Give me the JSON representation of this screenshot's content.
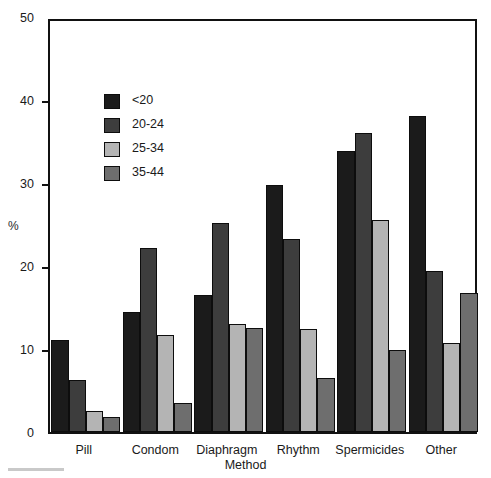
{
  "chart_data": {
    "type": "bar",
    "title": "",
    "xlabel": "Method",
    "ylabel": "%",
    "ylim": [
      0,
      50
    ],
    "yticks": [
      0,
      10,
      20,
      30,
      40,
      50
    ],
    "ytick_labels": [
      "0",
      "10",
      "20",
      "30",
      "40",
      "50"
    ],
    "grid": false,
    "legend_position": "inside-upper-left",
    "categories": [
      "Pill",
      "Condom",
      "Diaphragm",
      "Rhythm",
      "Spermicides",
      "Other"
    ],
    "series": [
      {
        "name": "<20",
        "color": "#1b1b1b",
        "values": [
          11.1,
          14.4,
          16.5,
          29.8,
          33.8,
          38.1
        ]
      },
      {
        "name": "20-24",
        "color": "#3d3d3d",
        "values": [
          6.3,
          22.2,
          25.2,
          23.3,
          36.0,
          19.4
        ]
      },
      {
        "name": "25-34",
        "color": "#b4b4b4",
        "values": [
          2.5,
          11.7,
          13.0,
          12.4,
          25.6,
          10.7
        ]
      },
      {
        "name": "35-44",
        "color": "#6e6e6e",
        "values": [
          1.8,
          3.5,
          12.5,
          6.5,
          9.9,
          16.7
        ]
      }
    ]
  },
  "legend": {
    "items": [
      {
        "label": "<20"
      },
      {
        "label": "20-24"
      },
      {
        "label": "25-34"
      },
      {
        "label": "35-44"
      }
    ]
  }
}
